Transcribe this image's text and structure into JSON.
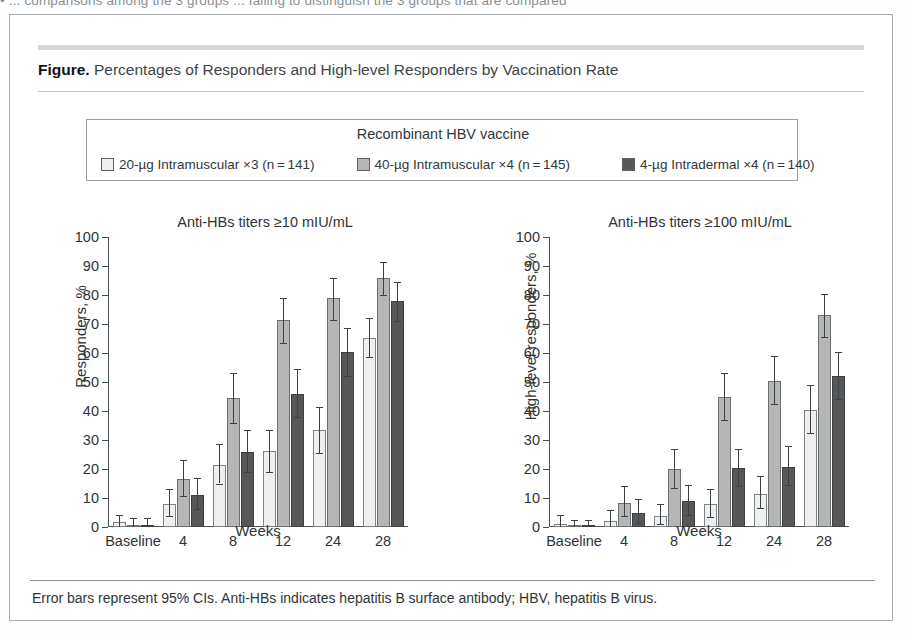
{
  "running_head": {
    "text": "•  ...  comparisons among the 3 groups ... failing to distinguish the 3 groups that are compared"
  },
  "figure": {
    "label": "Figure.",
    "title": " Percentages of Responders and High-level Responders by Vaccination Rate",
    "footnote": "Error bars represent 95% CIs. Anti-HBs indicates hepatitis B surface antibody; HBV, hepatitis B virus."
  },
  "legend": {
    "title": "Recombinant HBV vaccine",
    "items": [
      {
        "label": "20-µg Intramuscular ×3 (n = 141)",
        "color": "#efefef"
      },
      {
        "label": "40-µg Intramuscular ×4 (n = 145)",
        "color": "#b6b6b6"
      },
      {
        "label": "4-µg Intradermal ×4 (n = 140)",
        "color": "#555759"
      }
    ]
  },
  "chart_data": [
    {
      "type": "bar",
      "panel": "left",
      "title": "Anti-HBs titers ≥10 mIU/mL",
      "xlabel": "Weeks",
      "ylabel": "Responders, %",
      "ylim": [
        0,
        100
      ],
      "yticks": [
        0,
        10,
        20,
        30,
        40,
        50,
        60,
        70,
        80,
        90,
        100
      ],
      "grid": false,
      "legend_position": "top",
      "categories": [
        "Baseline",
        "4",
        "8",
        "12",
        "24",
        "28"
      ],
      "series": [
        {
          "name": "20-µg Intramuscular ×3 (n = 141)",
          "color": "#efefef",
          "values": [
            1.8,
            7.9,
            21.5,
            26.2,
            33.5,
            65.2
          ],
          "ci_low": [
            0.0,
            3.8,
            15.0,
            19.0,
            25.5,
            58.5
          ],
          "ci_high": [
            4.2,
            13.0,
            28.5,
            33.5,
            41.5,
            72.0
          ]
        },
        {
          "name": "40-µg Intramuscular ×4 (n = 145)",
          "color": "#b6b6b6",
          "values": [
            0.7,
            16.5,
            44.5,
            71.5,
            79.0,
            86.0
          ],
          "ci_low": [
            0.0,
            10.6,
            36.0,
            63.5,
            71.5,
            80.0
          ],
          "ci_high": [
            3.0,
            23.0,
            53.0,
            79.0,
            86.0,
            91.5
          ]
        },
        {
          "name": "4-µg Intradermal ×4 (n = 140)",
          "color": "#555759",
          "values": [
            0.7,
            11.2,
            26.0,
            46.0,
            60.5,
            78.0
          ],
          "ci_low": [
            0.0,
            6.2,
            19.0,
            38.0,
            52.0,
            71.0
          ],
          "ci_high": [
            3.2,
            17.0,
            33.5,
            54.5,
            68.5,
            84.5
          ]
        }
      ]
    },
    {
      "type": "bar",
      "panel": "right",
      "title": "Anti-HBs titers ≥100 mIU/mL",
      "xlabel": "Weeks",
      "ylabel": "High-level responders, %",
      "ylim": [
        0,
        100
      ],
      "yticks": [
        0,
        10,
        20,
        30,
        40,
        50,
        60,
        70,
        80,
        90,
        100
      ],
      "grid": false,
      "legend_position": "top",
      "categories": [
        "Baseline",
        "4",
        "8",
        "12",
        "24",
        "28"
      ],
      "series": [
        {
          "name": "20-µg Intramuscular ×3 (n = 141)",
          "color": "#efefef",
          "values": [
            1.0,
            2.2,
            3.8,
            7.8,
            11.5,
            40.5
          ],
          "ci_low": [
            0.0,
            0.0,
            1.0,
            3.5,
            6.5,
            32.5
          ],
          "ci_high": [
            4.0,
            6.0,
            8.0,
            13.0,
            17.5,
            49.0
          ]
        },
        {
          "name": "40-µg Intramuscular ×4 (n = 145)",
          "color": "#b6b6b6",
          "values": [
            0.2,
            8.2,
            20.0,
            45.0,
            50.5,
            73.0
          ],
          "ci_low": [
            0.0,
            3.8,
            13.5,
            37.0,
            42.5,
            65.5
          ],
          "ci_high": [
            2.5,
            14.0,
            27.0,
            53.0,
            59.0,
            80.5
          ]
        },
        {
          "name": "4-µg Intradermal ×4 (n = 140)",
          "color": "#555759",
          "values": [
            0.2,
            4.9,
            8.8,
            20.2,
            20.8,
            52.0
          ],
          "ci_low": [
            0.0,
            1.5,
            4.0,
            14.0,
            14.5,
            44.0
          ],
          "ci_high": [
            2.5,
            9.5,
            14.5,
            27.0,
            28.0,
            60.5
          ]
        }
      ]
    }
  ]
}
